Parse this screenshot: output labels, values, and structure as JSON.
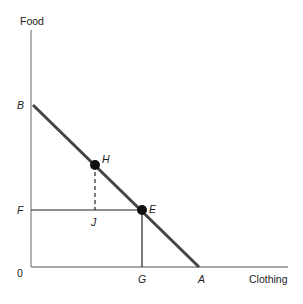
{
  "diagram": {
    "type": "budget-constraint",
    "axes": {
      "y_label": "Food",
      "x_label": "Clothing",
      "origin_label": "0"
    },
    "points": {
      "B": {
        "label": "B",
        "desc": "y-intercept of budget line"
      },
      "A": {
        "label": "A",
        "desc": "x-intercept of budget line"
      },
      "H": {
        "label": "H",
        "desc": "point on budget line"
      },
      "E": {
        "label": "E",
        "desc": "point on budget line"
      },
      "F": {
        "label": "F",
        "desc": "food level at E"
      },
      "G": {
        "label": "G",
        "desc": "clothing level at E"
      },
      "J": {
        "label": "J",
        "desc": "point below H at food level F"
      }
    },
    "colors": {
      "budget_line": "#444444",
      "axes": "#888888",
      "guides": "#222222",
      "points": "#111111"
    }
  }
}
